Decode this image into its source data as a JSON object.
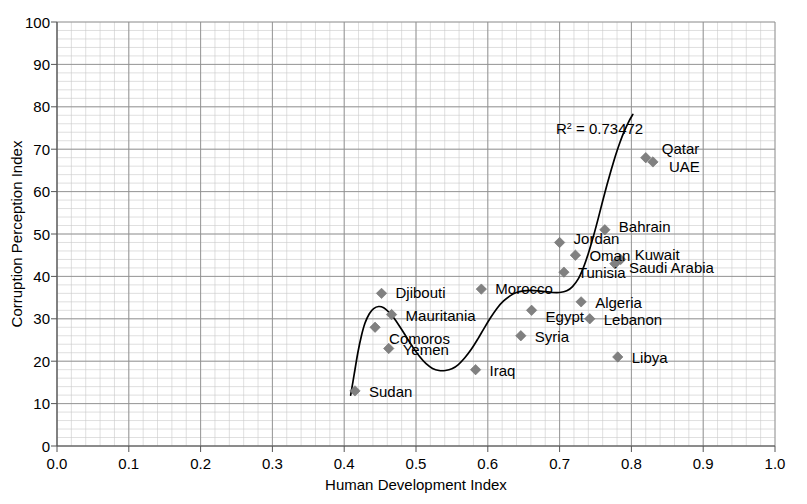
{
  "chart_data": {
    "type": "scatter",
    "title": "",
    "xlabel": "Human Development Index",
    "ylabel": "Corruption Perception Index",
    "xlim": [
      0.0,
      1.0
    ],
    "ylim": [
      0,
      100
    ],
    "xticks": [
      "0.0",
      "0.1",
      "0.2",
      "0.3",
      "0.4",
      "0.5",
      "0.6",
      "0.7",
      "0.8",
      "0.9",
      "1.0"
    ],
    "yticks": [
      "0",
      "10",
      "20",
      "30",
      "40",
      "50",
      "60",
      "70",
      "80",
      "90",
      "100"
    ],
    "x_major_step": 0.1,
    "y_major_step": 10,
    "x_minor_step": 0.02,
    "y_minor_step": 2,
    "grid": true,
    "legend": "none",
    "marker": "diamond",
    "marker_color": "#808080",
    "trendline_color": "#000000",
    "annotation": {
      "text": "R = 0.73472",
      "base": "R",
      "superscript": "2",
      "rest": " = 0.73472",
      "x": 0.695,
      "y": 73.5
    },
    "points": [
      {
        "label": "Sudan",
        "x": 0.415,
        "y": 13,
        "label_dx": 14,
        "label_dy": 6
      },
      {
        "label": "Comoros",
        "x": 0.443,
        "y": 28,
        "label_dx": 14,
        "label_dy": 17
      },
      {
        "label": "Djibouti",
        "x": 0.452,
        "y": 36,
        "label_dx": 14,
        "label_dy": 5
      },
      {
        "label": "Mauritania",
        "x": 0.466,
        "y": 31,
        "label_dx": 14,
        "label_dy": 6
      },
      {
        "label": "Yemen",
        "x": 0.462,
        "y": 23,
        "label_dx": 14,
        "label_dy": 7
      },
      {
        "label": "Iraq",
        "x": 0.583,
        "y": 18,
        "label_dx": 14,
        "label_dy": 6
      },
      {
        "label": "Morocco",
        "x": 0.591,
        "y": 37,
        "label_dx": 14,
        "label_dy": 5
      },
      {
        "label": "Syria",
        "x": 0.646,
        "y": 26,
        "label_dx": 14,
        "label_dy": 6
      },
      {
        "label": "Egypt",
        "x": 0.661,
        "y": 32,
        "label_dx": 14,
        "label_dy": 12
      },
      {
        "label": "Tunisia",
        "x": 0.706,
        "y": 41,
        "label_dx": 14,
        "label_dy": 6
      },
      {
        "label": "Jordan",
        "x": 0.7,
        "y": 48,
        "label_dx": 14,
        "label_dy": 2
      },
      {
        "label": "Oman",
        "x": 0.722,
        "y": 45,
        "label_dx": 14,
        "label_dy": 6
      },
      {
        "label": "Algeria",
        "x": 0.73,
        "y": 34,
        "label_dx": 14,
        "label_dy": 6
      },
      {
        "label": "Lebanon",
        "x": 0.742,
        "y": 30,
        "label_dx": 14,
        "label_dy": 6
      },
      {
        "label": "Bahrain",
        "x": 0.763,
        "y": 51,
        "label_dx": 14,
        "label_dy": 2
      },
      {
        "label": "Saudi Arabia",
        "x": 0.777,
        "y": 43,
        "label_dx": 14,
        "label_dy": 9
      },
      {
        "label": "Kuwait",
        "x": 0.785,
        "y": 44,
        "label_dx": 14,
        "label_dy": 1
      },
      {
        "label": "Libya",
        "x": 0.781,
        "y": 21,
        "label_dx": 14,
        "label_dy": 6
      },
      {
        "label": "Qatar",
        "x": 0.82,
        "y": 68,
        "label_dx": 16,
        "label_dy": -4
      },
      {
        "label": "UAE",
        "x": 0.83,
        "y": 67,
        "label_dx": 16,
        "label_dy": 10
      }
    ],
    "trendline": [
      [
        0.409,
        12.0
      ],
      [
        0.414,
        17.0
      ],
      [
        0.419,
        22.0
      ],
      [
        0.424,
        26.0
      ],
      [
        0.429,
        29.0
      ],
      [
        0.435,
        31.2
      ],
      [
        0.441,
        32.4
      ],
      [
        0.448,
        32.9
      ],
      [
        0.455,
        32.6
      ],
      [
        0.462,
        31.6
      ],
      [
        0.47,
        30.0
      ],
      [
        0.478,
        28.0
      ],
      [
        0.487,
        25.6
      ],
      [
        0.496,
        23.2
      ],
      [
        0.505,
        21.1
      ],
      [
        0.514,
        19.4
      ],
      [
        0.523,
        18.3
      ],
      [
        0.532,
        17.8
      ],
      [
        0.541,
        17.8
      ],
      [
        0.55,
        18.2
      ],
      [
        0.559,
        19.2
      ],
      [
        0.568,
        20.8
      ],
      [
        0.577,
        22.8
      ],
      [
        0.586,
        25.2
      ],
      [
        0.595,
        27.8
      ],
      [
        0.604,
        30.3
      ],
      [
        0.613,
        32.5
      ],
      [
        0.622,
        34.2
      ],
      [
        0.631,
        35.4
      ],
      [
        0.64,
        36.2
      ],
      [
        0.65,
        36.6
      ],
      [
        0.66,
        36.7
      ],
      [
        0.67,
        36.6
      ],
      [
        0.68,
        36.4
      ],
      [
        0.69,
        36.2
      ],
      [
        0.7,
        36.2
      ],
      [
        0.71,
        36.6
      ],
      [
        0.718,
        37.6
      ],
      [
        0.726,
        39.4
      ],
      [
        0.733,
        42.0
      ],
      [
        0.74,
        45.4
      ],
      [
        0.747,
        49.4
      ],
      [
        0.754,
        53.8
      ],
      [
        0.76,
        57.8
      ],
      [
        0.766,
        61.6
      ],
      [
        0.772,
        65.2
      ],
      [
        0.778,
        68.6
      ],
      [
        0.784,
        71.6
      ],
      [
        0.79,
        74.2
      ],
      [
        0.796,
        76.4
      ],
      [
        0.802,
        78.2
      ]
    ]
  }
}
